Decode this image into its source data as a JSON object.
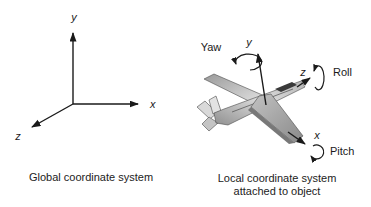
{
  "global_system": {
    "axis_labels": {
      "x": "x",
      "y": "y",
      "z": "z"
    },
    "caption": "Global coordinate system"
  },
  "local_system": {
    "axis_labels": {
      "x": "x",
      "y": "y",
      "z": "z"
    },
    "rotation_labels": {
      "yaw": "Yaw",
      "roll": "Roll",
      "pitch": "Pitch"
    },
    "caption_line1": "Local coordinate system",
    "caption_line2": "attached to object"
  },
  "colors": {
    "ink": "#1a1a1a",
    "caption_text": "#222222",
    "plane_light": "#e8e8e8",
    "plane_mid": "#a8a8a8",
    "plane_dark": "#6f6f6f",
    "canopy": "#3a3a3a",
    "background": "#ffffff"
  }
}
